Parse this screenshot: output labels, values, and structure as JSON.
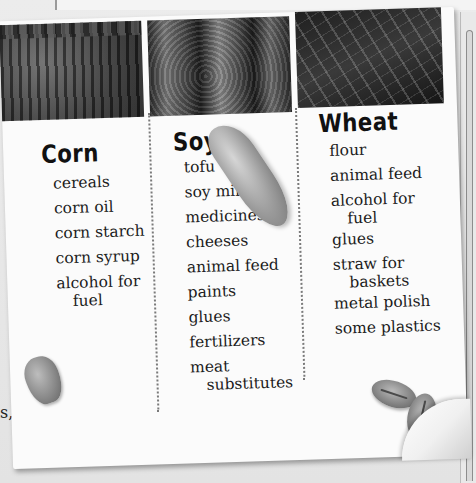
{
  "background": {
    "partial_text": "s,"
  },
  "columns": [
    {
      "heading": "Corn",
      "photo": "corn-field-photo",
      "items": [
        {
          "text": "cereals"
        },
        {
          "text": "corn oil"
        },
        {
          "text": "corn starch"
        },
        {
          "text": "corn syrup"
        },
        {
          "text": "alcohol for",
          "continuation": "fuel"
        }
      ]
    },
    {
      "heading": "Soy",
      "photo": "soybean-field-photo",
      "items": [
        {
          "text": "tofu"
        },
        {
          "text": "soy milk"
        },
        {
          "text": "medicines"
        },
        {
          "text": "cheeses"
        },
        {
          "text": "animal feed"
        },
        {
          "text": "paints"
        },
        {
          "text": "glues"
        },
        {
          "text": "fertilizers"
        },
        {
          "text": "meat",
          "continuation": "substitutes"
        }
      ]
    },
    {
      "heading": "Wheat",
      "photo": "wheat-field-photo",
      "items": [
        {
          "text": "flour"
        },
        {
          "text": "animal feed"
        },
        {
          "text": "alcohol for",
          "continuation": "fuel"
        },
        {
          "text": "glues"
        },
        {
          "text": "straw for",
          "continuation": "baskets"
        },
        {
          "text": "metal polish"
        },
        {
          "text": "some plastics"
        }
      ]
    }
  ],
  "decorations": [
    "soybean-pod",
    "corn-kernel",
    "wheat-grain",
    "wheat-grain"
  ]
}
